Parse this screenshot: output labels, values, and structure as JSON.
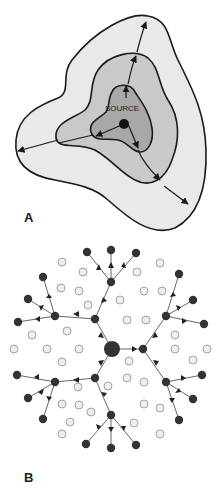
{
  "panels": [
    {
      "id": "A",
      "label": "A",
      "source_label": "SOURCE",
      "description": "Concentric expanding fronts from a source with arrows radiating outward",
      "colors": {
        "outer": "#e9e9e9",
        "middle": "#c9c9c9",
        "inner": "#a8a8a8",
        "stroke": "#1a1a1a"
      }
    },
    {
      "id": "B",
      "label": "B",
      "description": "Branching network from a central node; dark nodes reached, light nodes unreached",
      "colors": {
        "active_node": "#333333",
        "inactive_fill": "#eeeeee",
        "inactive_stroke": "#9a9a9a",
        "edge": "#555555"
      }
    }
  ]
}
